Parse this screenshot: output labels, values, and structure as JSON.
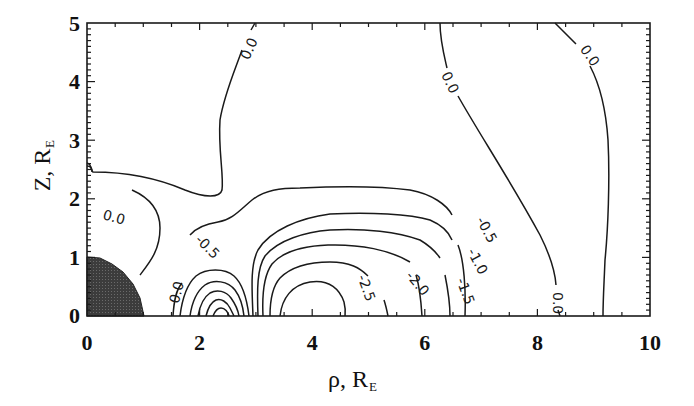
{
  "chart_data": {
    "type": "contour",
    "title": "",
    "xlabel": "ρ, R_E",
    "xlabel_main": "ρ, R",
    "xlabel_sub": "E",
    "ylabel": "Z, R_E",
    "ylabel_main": "Z, R",
    "ylabel_sub": "E",
    "xlim": [
      0,
      10
    ],
    "ylim": [
      0,
      5
    ],
    "x_ticks": [
      "0",
      "2",
      "4",
      "6",
      "8",
      "10"
    ],
    "y_ticks": [
      "0",
      "1",
      "2",
      "3",
      "4",
      "5"
    ],
    "grid": false,
    "legend": null,
    "shaded_region": {
      "description": "Earth (filled quarter disk)",
      "radius": 1.0,
      "color": "#3a3a3a"
    },
    "contour_levels": [
      "0.0",
      "-0.5",
      "-1.0",
      "-1.5",
      "-2.0",
      "-2.5"
    ],
    "contour_labels": [
      {
        "text": "0.0",
        "rho": 0.5,
        "z": 2.0
      },
      {
        "text": "0.0",
        "rho": 2.95,
        "z": 4.6
      },
      {
        "text": "0.0",
        "rho": 6.1,
        "z": 4.1
      },
      {
        "text": "0.0",
        "rho": 8.9,
        "z": 4.7
      },
      {
        "text": "0.0",
        "rho": 8.45,
        "z": 0.45
      },
      {
        "text": "0.0",
        "rho": 1.7,
        "z": 0.35
      },
      {
        "text": "-0.5",
        "rho": 1.95,
        "z": 1.15
      },
      {
        "text": "-0.5",
        "rho": 7.1,
        "z": 1.35
      },
      {
        "text": "-1.0",
        "rho": 6.85,
        "z": 1.05
      },
      {
        "text": "-1.5",
        "rho": 6.6,
        "z": 0.75
      },
      {
        "text": "-2.0",
        "rho": 5.4,
        "z": 0.85
      },
      {
        "text": "-2.5",
        "rho": 4.5,
        "z": 0.7
      }
    ]
  }
}
